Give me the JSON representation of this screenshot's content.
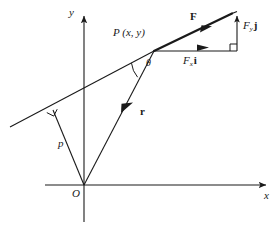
{
  "figure": {
    "type": "vector-diagram",
    "background_color": "#ffffff",
    "stroke_color": "#1a1a1a"
  },
  "axes": {
    "x_label": "x",
    "y_label": "y",
    "origin_label": "O",
    "x_axis": {
      "x1": 45,
      "y1": 185,
      "x2": 272,
      "y2": 185
    },
    "y_axis": {
      "x1": 84,
      "y1": 222,
      "x2": 84,
      "y2": 10
    },
    "origin": {
      "x": 84,
      "y": 185
    }
  },
  "labels": {
    "point_P": "P (x, y)",
    "force": "F",
    "force_x_component": "F",
    "force_x_subscript": "x",
    "force_x_unit": "i",
    "force_y_component": "F",
    "force_y_subscript": "y",
    "force_y_unit": "j",
    "position_vector": "r",
    "perpendicular_distance": "p",
    "angle": "θ"
  },
  "geometry": {
    "line_of_action": {
      "x1": 10,
      "y1": 127,
      "x2": 237,
      "y2": 12
    },
    "point_P": {
      "x": 154,
      "y": 51
    },
    "force_arrow_tip": {
      "x": 237,
      "y": 12
    },
    "force_head_sample": {
      "x": 205,
      "y": 28
    },
    "fx_arrow": {
      "x1": 154,
      "y1": 51,
      "x2": 237,
      "y2": 51
    },
    "fy_arrow": {
      "x1": 237,
      "y1": 51,
      "x2": 237,
      "y2": 14
    },
    "position_vector_r": {
      "x1": 84,
      "y1": 185,
      "x2": 154,
      "y2": 51
    },
    "perpendicular_foot": {
      "x": 53,
      "y": 110
    },
    "perpendicular_p": {
      "x1": 84,
      "y1": 185,
      "x2": 53,
      "y2": 110
    }
  }
}
